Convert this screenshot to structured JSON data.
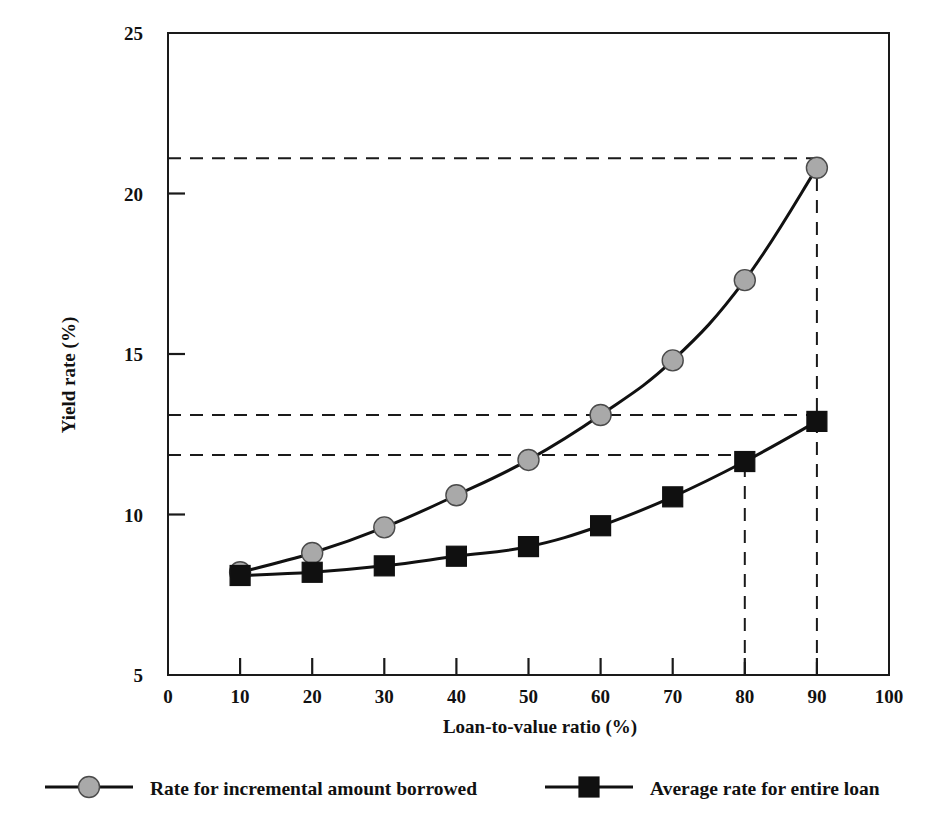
{
  "chart_data": {
    "type": "line",
    "title": "",
    "xlabel": "Loan-to-value ratio (%)",
    "ylabel": "Yield rate (%)",
    "xlim": [
      0,
      100
    ],
    "ylim": [
      5,
      25
    ],
    "xticks": [
      0,
      10,
      20,
      30,
      40,
      50,
      60,
      70,
      80,
      90,
      100
    ],
    "xtick_labels": [
      "0",
      "10",
      "20",
      "30",
      "40",
      "50",
      "60",
      "70",
      "80",
      "90",
      "100"
    ],
    "yticks": [
      5,
      10,
      15,
      20,
      25
    ],
    "ytick_labels": [
      "5",
      "10",
      "15",
      "20",
      "25"
    ],
    "grid": false,
    "legend_position": "below",
    "x": [
      10,
      20,
      30,
      40,
      50,
      60,
      70,
      80,
      90
    ],
    "series": [
      {
        "name": "Rate for incremental amount borrowed",
        "marker": "circle",
        "marker_color": "#a9a9a9",
        "line_color": "#111111",
        "values": [
          8.2,
          8.8,
          9.6,
          10.6,
          11.7,
          13.1,
          14.8,
          17.3,
          20.8
        ]
      },
      {
        "name": "Average rate for entire loan",
        "marker": "square",
        "marker_color": "#101010",
        "line_color": "#111111",
        "values": [
          8.1,
          8.2,
          8.4,
          8.7,
          9.0,
          9.65,
          10.55,
          11.65,
          12.9
        ]
      }
    ],
    "reference_lines": [
      {
        "orientation": "horizontal",
        "value": 21.1,
        "from_x": 0,
        "to_x": 90,
        "style": "dashed"
      },
      {
        "orientation": "horizontal",
        "value": 13.1,
        "from_x": 0,
        "to_x": 90,
        "style": "dashed"
      },
      {
        "orientation": "horizontal",
        "value": 11.85,
        "from_x": 0,
        "to_x": 80,
        "style": "dashed"
      },
      {
        "orientation": "vertical",
        "value": 80,
        "from_y": 5,
        "to_y": 11.85,
        "style": "dashed"
      },
      {
        "orientation": "vertical",
        "value": 90,
        "from_y": 5,
        "to_y": 20.8,
        "style": "dashed"
      }
    ]
  },
  "legend": {
    "items": [
      {
        "label": "Rate for incremental amount borrowed",
        "marker": "circle"
      },
      {
        "label": "Average rate for entire loan",
        "marker": "square"
      }
    ]
  },
  "colors": {
    "axis": "#1a1a1a",
    "line": "#111111",
    "circle_marker": "#a9a9a9",
    "square_marker": "#101010",
    "background": "#ffffff"
  }
}
